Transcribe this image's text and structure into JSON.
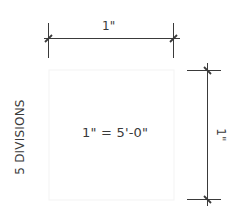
{
  "diagram": {
    "type": "scale-dimension-drawing",
    "top_dimension": {
      "label": "1\""
    },
    "right_dimension": {
      "label": "1\""
    },
    "center_label": "1\" = 5'-0\"",
    "side_label": "5 DIVISIONS",
    "colors": {
      "line": "#333333",
      "text": "#3a3a3a",
      "faint_guide": "#f2f2f2",
      "background": "#ffffff"
    }
  }
}
